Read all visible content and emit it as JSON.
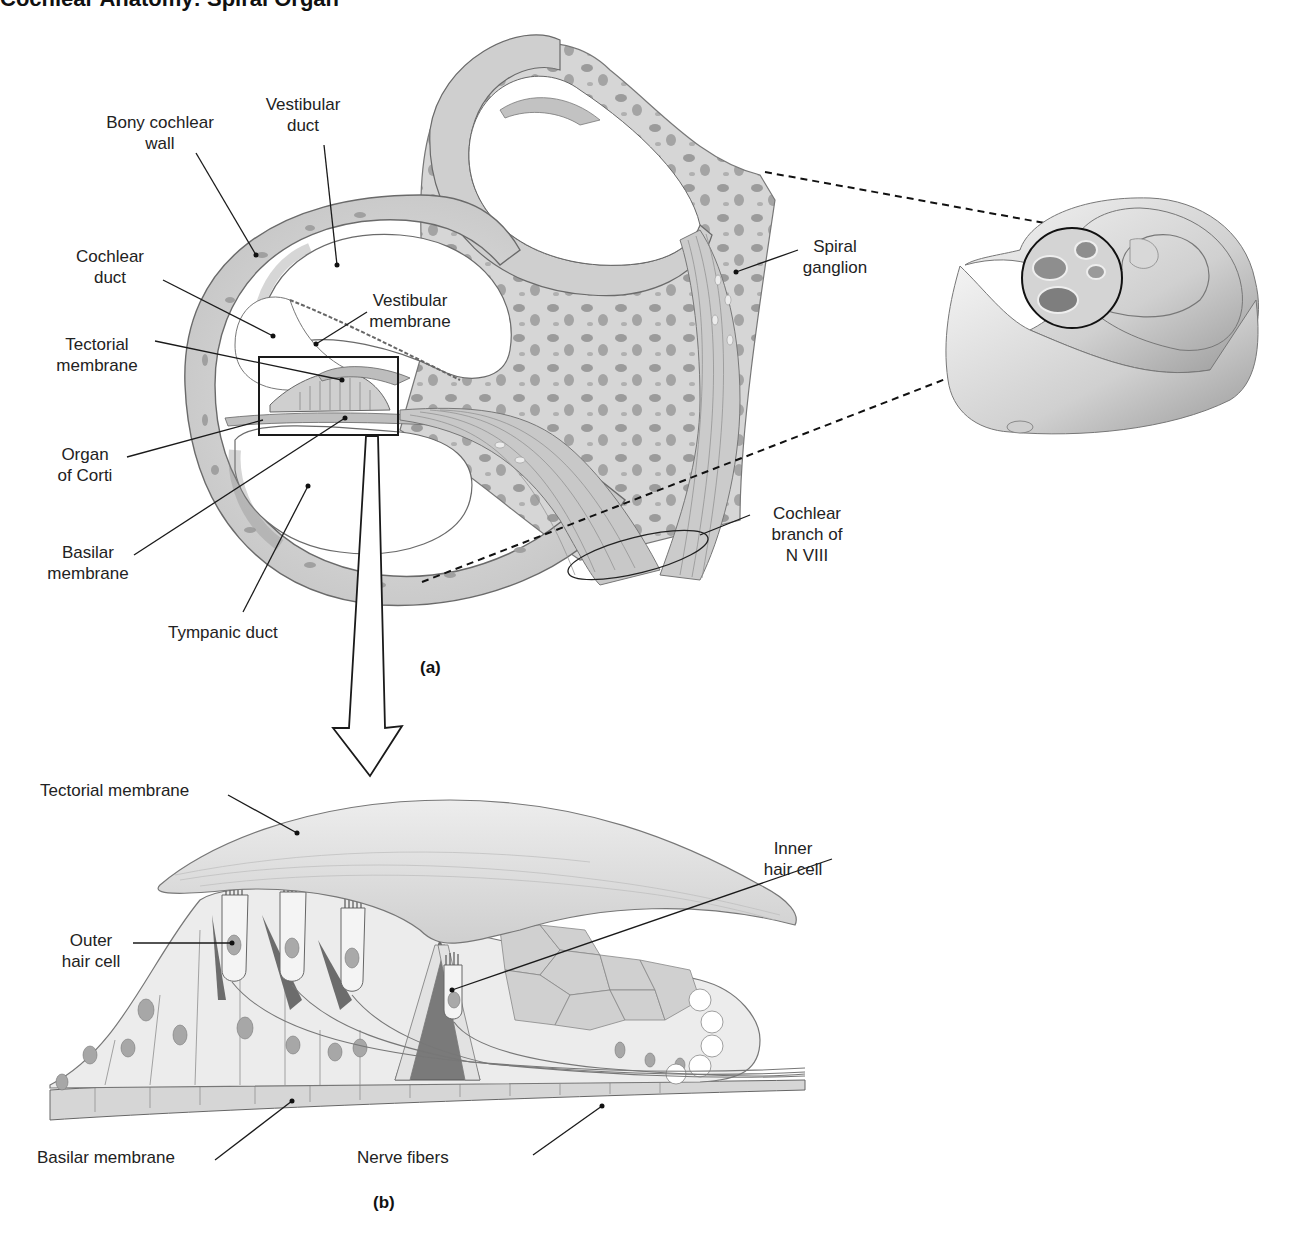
{
  "figure": {
    "title_fragment": "Cochlear Anatomy: Spiral Organ",
    "panels": [
      {
        "id": "a",
        "tag": "(a)"
      },
      {
        "id": "b",
        "tag": "(b)"
      }
    ]
  },
  "panel_a": {
    "labels": {
      "bony_cochlear_wall": [
        "Bony cochlear",
        "wall"
      ],
      "vestibular_duct": [
        "Vestibular",
        "duct"
      ],
      "cochlear_duct": [
        "Cochlear",
        "duct"
      ],
      "vestibular_membrane": [
        "Vestibular",
        "membrane"
      ],
      "tectorial_membrane": [
        "Tectorial",
        "membrane"
      ],
      "organ_of_corti": [
        "Organ",
        "of Corti"
      ],
      "basilar_membrane": [
        "Basilar",
        "membrane"
      ],
      "tympanic_duct": [
        "Tympanic duct"
      ],
      "spiral_ganglion": [
        "Spiral",
        "ganglion"
      ],
      "cochlear_branch": [
        "Cochlear",
        "branch of",
        "N VIII"
      ]
    },
    "tag": "(a)"
  },
  "panel_b": {
    "labels": {
      "tectorial_membrane": "Tectorial membrane",
      "inner_hair_cell": [
        "Inner",
        "hair cell"
      ],
      "outer_hair_cell": [
        "Outer",
        "hair cell"
      ],
      "basilar_membrane": "Basilar membrane",
      "nerve_fibers": "Nerve fibers"
    },
    "tag": "(b)"
  },
  "colors": {
    "bone": "#d9d9d9",
    "bone_dark": "#a8a8a8",
    "duct_shadow": "#9c9c9c",
    "membrane": "#e6e6e6",
    "line": "#1a1a1a",
    "cell_fill": "#ececec",
    "nucleus": "#9a9a9a"
  }
}
